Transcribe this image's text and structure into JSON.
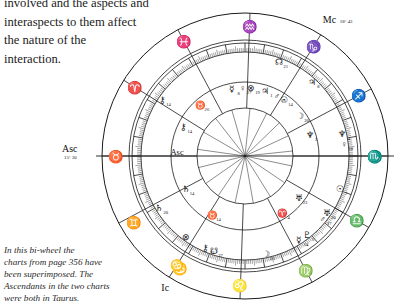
{
  "page": {
    "body_text_lines": [
      "involved and the aspects and",
      "interaspects to them affect",
      "the nature of the",
      "interaction."
    ],
    "caption_lines": [
      "In this bi-wheel the",
      "charts from page 356 have",
      "been superimposed. The",
      "Ascendants in the two charts",
      "were both in Taurus."
    ]
  },
  "chart_data": {
    "type": "bi-wheel",
    "ink_color": "#1a1a1a",
    "geometry": {
      "cx": 150,
      "cy": 152,
      "r_outer": 143,
      "r_sign_ring_inner": 116,
      "r_tick_ring_outer": 113,
      "r_tick_ring_inner": 104,
      "r_outer_planets": 100,
      "r_middle": 74,
      "r_inner_planets": 68,
      "r_inner_wheel": 48
    },
    "angles": [
      {
        "name": "Asc",
        "label": "Asc",
        "degree_label": "15° 20",
        "sign": "taurus",
        "sign_glyph": "♉",
        "pos_deg": 180
      },
      {
        "name": "Desc",
        "label": "De",
        "degree_label": "",
        "sign": "scorpio",
        "sign_glyph": "♏",
        "pos_deg": 0
      },
      {
        "name": "MC",
        "label": "Mc",
        "degree_label": "18° 43",
        "sign": "capricorn",
        "sign_glyph": "♑",
        "pos_deg": 58
      },
      {
        "name": "IC",
        "label": "Ic",
        "degree_label": "",
        "sign": "cancer",
        "sign_glyph": "♋",
        "pos_deg": 238
      }
    ],
    "zodiac_signs": [
      {
        "name": "aquarius",
        "glyph": "♒",
        "pos_deg": 88
      },
      {
        "name": "pisces",
        "glyph": "♓",
        "pos_deg": 118
      },
      {
        "name": "aries",
        "glyph": "♈",
        "pos_deg": 148
      },
      {
        "name": "taurus",
        "glyph": "♉",
        "pos_deg": 180
      },
      {
        "name": "gemini",
        "glyph": "♊",
        "pos_deg": 211
      },
      {
        "name": "cancer",
        "glyph": "♋",
        "pos_deg": 240
      },
      {
        "name": "leo",
        "glyph": "♌",
        "pos_deg": 268
      },
      {
        "name": "virgo",
        "glyph": "♍",
        "pos_deg": 298
      },
      {
        "name": "libra",
        "glyph": "♎",
        "pos_deg": 330
      },
      {
        "name": "scorpio",
        "glyph": "♏",
        "pos_deg": 0
      },
      {
        "name": "sagittarius",
        "glyph": "♐",
        "pos_deg": 28
      },
      {
        "name": "capricorn",
        "glyph": "♑",
        "pos_deg": 58
      }
    ],
    "outer_chart_planets": [
      {
        "name": "north-node",
        "glyph": "☊",
        "degree": "21",
        "pos_deg": 70
      },
      {
        "name": "jupiter",
        "glyph": "♃",
        "degree": "8",
        "pos_deg": 48
      },
      {
        "name": "neptune",
        "glyph": "♆",
        "degree": "4",
        "pos_deg": 13
      },
      {
        "name": "venus",
        "glyph": "♀",
        "degree": "10",
        "pos_deg": 7
      },
      {
        "name": "sun",
        "glyph": "☉",
        "degree": "7",
        "pos_deg": -19
      },
      {
        "name": "uranus",
        "glyph": "♅",
        "degree": "20",
        "pos_deg": -35
      },
      {
        "name": "mars",
        "glyph": "♂",
        "degree": "17",
        "pos_deg": -39
      },
      {
        "name": "pluto",
        "glyph": "♇",
        "degree": "5",
        "pos_deg": -52
      },
      {
        "name": "mercury",
        "glyph": "☿",
        "degree": "14",
        "pos_deg": -57
      },
      {
        "name": "moon",
        "glyph": "☽",
        "degree": "26",
        "pos_deg": -78
      },
      {
        "name": "south-node",
        "glyph": "☋",
        "degree": "27",
        "pos_deg": -108
      },
      {
        "name": "chiron",
        "glyph": "⚷",
        "degree": "21",
        "pos_deg": -113
      },
      {
        "name": "part-fortune",
        "glyph": "⊗",
        "degree": "",
        "pos_deg": -126
      },
      {
        "name": "saturn",
        "glyph": "♄",
        "degree": "20",
        "pos_deg": -149
      },
      {
        "name": "chiron-2",
        "glyph": "⚷",
        "degree": "14",
        "pos_deg": 146
      }
    ],
    "inner_chart_planets": [
      {
        "name": "mercury",
        "glyph": "☿",
        "degree": "8",
        "pos_deg": 101
      },
      {
        "name": "venus",
        "glyph": "♀",
        "degree": "27",
        "pos_deg": 92
      },
      {
        "name": "part-fortune",
        "glyph": "⊗",
        "degree": "19",
        "pos_deg": 85
      },
      {
        "name": "jupiter",
        "glyph": "♃",
        "degree": "1",
        "pos_deg": 73
      },
      {
        "name": "mars",
        "glyph": "♂",
        "degree": "15",
        "pos_deg": 62
      },
      {
        "name": "sun",
        "glyph": "☉",
        "degree": "14",
        "pos_deg": 55
      },
      {
        "name": "moon",
        "glyph": "☽",
        "degree": "20",
        "pos_deg": 36
      },
      {
        "name": "neptune",
        "glyph": "♆",
        "degree": "2",
        "pos_deg": 18
      },
      {
        "name": "uranus",
        "glyph": "♅",
        "degree": "23",
        "pos_deg": -38
      },
      {
        "name": "aries-point",
        "glyph": "♈",
        "degree": "4",
        "pos_deg": -57
      },
      {
        "name": "taurus-pt",
        "glyph": "♉",
        "degree": "14",
        "pos_deg": -119
      },
      {
        "name": "saturn",
        "glyph": "♄",
        "degree": "14",
        "pos_deg": -151
      },
      {
        "name": "chiron",
        "glyph": "⚷",
        "degree": "14",
        "pos_deg": 155
      },
      {
        "name": "taurus-node",
        "glyph": "♉",
        "degree": "26",
        "pos_deg": 131
      },
      {
        "name": "asc-marker",
        "glyph": "Asc",
        "degree": "",
        "pos_deg": 177
      }
    ],
    "house_cusp_angles": [
      0,
      28,
      58,
      88,
      118,
      148,
      180,
      208,
      238,
      268,
      298,
      330
    ],
    "aspect_line_angles": [
      6,
      25,
      44,
      63,
      84,
      106,
      128,
      150,
      172,
      194,
      215,
      236,
      258,
      280,
      302,
      326,
      348
    ]
  }
}
